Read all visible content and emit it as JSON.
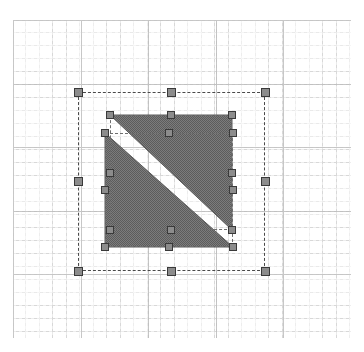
{
  "canvas": {
    "name": "vector-drawing-canvas",
    "width": 364,
    "height": 352,
    "background_color": "#ffffff"
  },
  "grid": {
    "name": "alignment-grid",
    "visible": true,
    "origin_x": 13,
    "origin_y": 20,
    "width": 338,
    "height": 318,
    "minor_spacing_x": 13,
    "minor_spacing_y": 13,
    "major_spacing_x": 68,
    "major_spacing_y": 64,
    "minor_color": "#d8d8d8",
    "major_color": "#c2c2c2",
    "minor_style": "dotted",
    "major_style": "dashed"
  },
  "selection": {
    "outer": {
      "name": "group-selection-bounds",
      "x": 78,
      "y": 92,
      "width": 187,
      "height": 179,
      "stroke_color": "#4a4a4a",
      "stroke_style": "dashed",
      "handle_fill": "#8c8c8c",
      "handle_stroke": "#3a3a3a",
      "handle_size": 9,
      "handles": [
        {
          "name": "handle-nw",
          "x": 78,
          "y": 92
        },
        {
          "name": "handle-n",
          "x": 171,
          "y": 92
        },
        {
          "name": "handle-ne",
          "x": 265,
          "y": 92
        },
        {
          "name": "handle-w",
          "x": 78,
          "y": 181
        },
        {
          "name": "handle-e",
          "x": 265,
          "y": 181
        },
        {
          "name": "handle-sw",
          "x": 78,
          "y": 271
        },
        {
          "name": "handle-s",
          "x": 171,
          "y": 271
        },
        {
          "name": "handle-se",
          "x": 265,
          "y": 271
        }
      ]
    },
    "shape_a": {
      "name": "triangle-upper-selection-bounds",
      "x": 110,
      "y": 115,
      "width": 122,
      "height": 115,
      "stroke_color": "#6e6e6e",
      "stroke_style": "dashed",
      "handles": [
        {
          "name": "handle-nw",
          "x": 110,
          "y": 115
        },
        {
          "name": "handle-n",
          "x": 171,
          "y": 115
        },
        {
          "name": "handle-ne",
          "x": 232,
          "y": 115
        },
        {
          "name": "handle-w",
          "x": 110,
          "y": 173
        },
        {
          "name": "handle-e",
          "x": 232,
          "y": 173
        },
        {
          "name": "handle-sw",
          "x": 110,
          "y": 230
        },
        {
          "name": "handle-s",
          "x": 171,
          "y": 230
        },
        {
          "name": "handle-se",
          "x": 232,
          "y": 230
        }
      ]
    },
    "shape_b": {
      "name": "triangle-lower-selection-bounds",
      "x": 105,
      "y": 133,
      "width": 128,
      "height": 114,
      "stroke_color": "#6e6e6e",
      "stroke_style": "dashed",
      "handles": [
        {
          "name": "handle-nw",
          "x": 105,
          "y": 133
        },
        {
          "name": "handle-n",
          "x": 169,
          "y": 133
        },
        {
          "name": "handle-ne",
          "x": 233,
          "y": 133
        },
        {
          "name": "handle-w",
          "x": 105,
          "y": 190
        },
        {
          "name": "handle-e",
          "x": 233,
          "y": 190
        },
        {
          "name": "handle-sw",
          "x": 105,
          "y": 247
        },
        {
          "name": "handle-s",
          "x": 169,
          "y": 247
        },
        {
          "name": "handle-se",
          "x": 233,
          "y": 247
        }
      ]
    }
  },
  "shapes": [
    {
      "name": "triangle-upper",
      "type": "triangle",
      "fill_color": "#6e6e6e",
      "fill_pattern": "50-percent-dither",
      "stroke_color": "#5a5a5a",
      "points": "110,115 232,115 232,230"
    },
    {
      "name": "triangle-lower",
      "type": "triangle",
      "fill_color": "#6e6e6e",
      "fill_pattern": "50-percent-dither",
      "stroke_color": "#5a5a5a",
      "points": "105,133 233,247 105,247"
    }
  ],
  "colors": {
    "shape_gray": "#6e6e6e",
    "handle_fill": "#8c8c8c",
    "handle_stroke": "#3a3a3a",
    "grid_minor": "#d8d8d8",
    "grid_major": "#c2c2c2",
    "canvas_background": "#ffffff"
  }
}
